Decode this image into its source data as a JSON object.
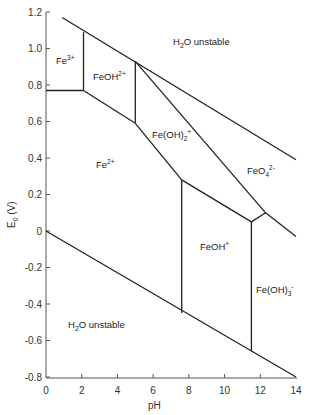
{
  "chart_data": {
    "type": "diagram",
    "title": "",
    "xlabel": "pH",
    "ylabel": "E0 (V)",
    "xlim": [
      0,
      14
    ],
    "ylim": [
      -0.8,
      1.2
    ],
    "x_ticks": [
      "0",
      "2",
      "4",
      "6",
      "8",
      "10",
      "12",
      "14"
    ],
    "y_ticks": [
      "1.2",
      "1.0",
      "0.8",
      "0.6",
      "0.4",
      "0.2",
      "0",
      "-0.2",
      "-0.4",
      "-0.6",
      "-0.8"
    ],
    "grid": false,
    "regions": [
      {
        "label": "H2O unstable",
        "position": "top"
      },
      {
        "label": "Fe3+"
      },
      {
        "label": "FeOH2+"
      },
      {
        "label": "Fe(OH)2+"
      },
      {
        "label": "FeO42-"
      },
      {
        "label": "Fe2+"
      },
      {
        "label": "FeOH+"
      },
      {
        "label": "Fe(OH)3-"
      },
      {
        "label": "H2O unstable",
        "position": "bottom"
      }
    ],
    "lines": [
      {
        "name": "O2/H2O upper water limit",
        "points": [
          [
            0.9,
            1.17
          ],
          [
            14,
            0.39
          ]
        ]
      },
      {
        "name": "H+/H2 lower water limit",
        "points": [
          [
            0,
            0.0
          ],
          [
            14,
            -0.8
          ]
        ]
      },
      {
        "name": "Fe3+/Fe2+",
        "points": [
          [
            0,
            0.77
          ],
          [
            2.1,
            0.77
          ]
        ]
      },
      {
        "name": "Fe3+/FeOH2+",
        "points": [
          [
            2.1,
            0.77
          ],
          [
            2.1,
            1.09
          ]
        ]
      },
      {
        "name": "FeOH2+/Fe2+",
        "points": [
          [
            2.1,
            0.77
          ],
          [
            5.0,
            0.59
          ]
        ]
      },
      {
        "name": "FeOH2+/Fe(OH)2+",
        "points": [
          [
            5.0,
            0.59
          ],
          [
            5.0,
            0.93
          ]
        ]
      },
      {
        "name": "Fe(OH)2+/Fe2+",
        "points": [
          [
            5.0,
            0.59
          ],
          [
            7.6,
            0.28
          ]
        ]
      },
      {
        "name": "Fe2+/FeOH+",
        "points": [
          [
            7.6,
            0.28
          ],
          [
            7.6,
            -0.45
          ]
        ]
      },
      {
        "name": "Fe(OH)2+/FeOH+",
        "points": [
          [
            7.6,
            0.28
          ],
          [
            11.5,
            0.05
          ]
        ]
      },
      {
        "name": "FeOH+/Fe(OH)3-",
        "points": [
          [
            11.5,
            0.05
          ],
          [
            11.5,
            -0.66
          ]
        ]
      },
      {
        "name": "Fe(OH)2+/Fe(OH)3- junction",
        "points": [
          [
            11.5,
            0.05
          ],
          [
            12.3,
            0.1
          ]
        ]
      },
      {
        "name": "Fe(OH)2+/FeO42-",
        "points": [
          [
            5.0,
            0.93
          ],
          [
            12.3,
            0.1
          ]
        ]
      },
      {
        "name": "FeO42-/Fe(OH)3-",
        "points": [
          [
            12.3,
            0.1
          ],
          [
            14,
            -0.03
          ]
        ]
      }
    ]
  },
  "labels": {
    "h2o_top_main": "H",
    "h2o_top_sub": "2",
    "h2o_top_rest": "O unstable",
    "h2o_bot_main": "H",
    "h2o_bot_sub": "2",
    "h2o_bot_rest": "O unstable",
    "fe3_main": "Fe",
    "fe3_sup": "3+",
    "feoh2_main": "FeOH",
    "feoh2_sup": "2+",
    "feoh2p_main": "Fe(OH)",
    "feoh2p_sub": "2",
    "feoh2p_sup": "+",
    "feo4_main": "FeO",
    "feo4_sub": "4",
    "feo4_sup": "2-",
    "fe2_main": "Fe",
    "fe2_sup": "2+",
    "feohp_main": "FeOH",
    "feohp_sup": "+",
    "feoh3_main": "Fe(OH)",
    "feoh3_sub": "3",
    "feoh3_sup": "-",
    "xlabel": "pH",
    "ylabel_main": "E",
    "ylabel_sub": "0",
    "ylabel_rest": " (V)"
  }
}
